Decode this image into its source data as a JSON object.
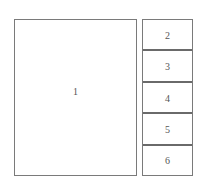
{
  "diagram": {
    "type": "layout-block-diagram",
    "colors": {
      "border": "#7a7a7a",
      "divider": "#6a6a6a",
      "text": "#555555",
      "background": "#ffffff"
    },
    "main_panel": {
      "label": "1"
    },
    "stack_panels": [
      {
        "label": "2"
      },
      {
        "label": "3"
      },
      {
        "label": "4"
      },
      {
        "label": "5"
      },
      {
        "label": "6"
      }
    ]
  }
}
